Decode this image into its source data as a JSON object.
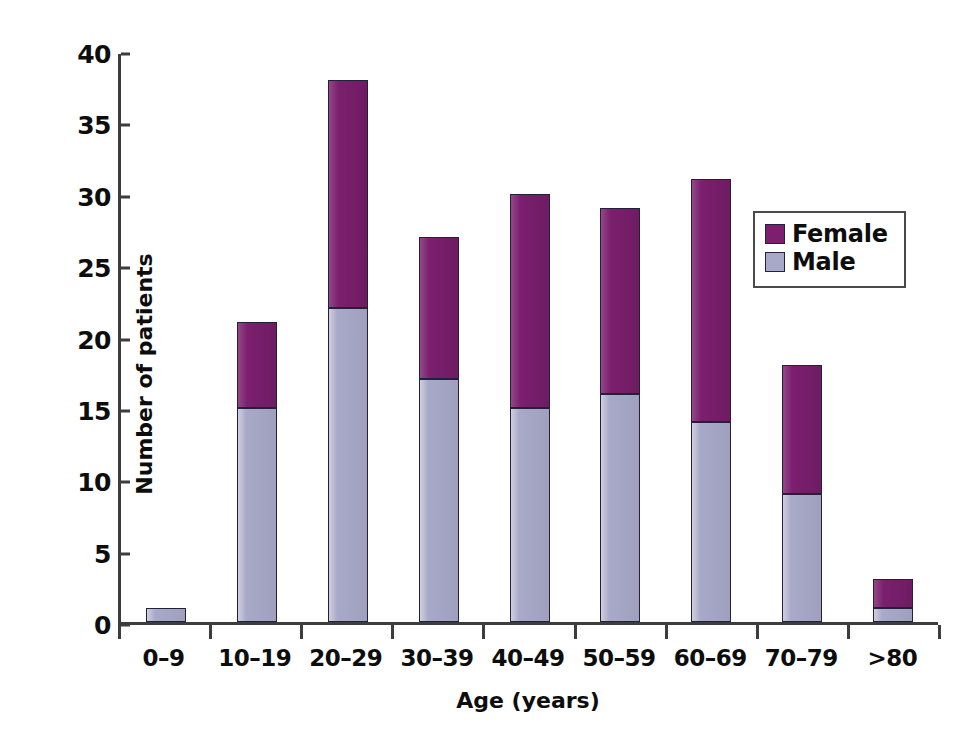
{
  "chart_data": {
    "type": "bar",
    "subtype": "stacked-vertical",
    "title": "",
    "xlabel": "Age (years)",
    "ylabel": "Number of patients",
    "ylim": [
      0,
      40
    ],
    "ytick_step": 5,
    "yticks": [
      "40",
      "35",
      "30",
      "25",
      "20",
      "15",
      "10",
      "5",
      "0"
    ],
    "grid": false,
    "legend_position": "top-right-inside",
    "categories": [
      "0–9",
      "10–19",
      "20–29",
      "30–39",
      "40–49",
      "50–59",
      "60–69",
      "70–79",
      ">80"
    ],
    "series": [
      {
        "name": "Male",
        "color": "#a8a8c8",
        "values": [
          1,
          15,
          22,
          17,
          15,
          16,
          14,
          9,
          1
        ]
      },
      {
        "name": "Female",
        "color": "#7b1f6e",
        "values": [
          0,
          6,
          16,
          10,
          15,
          13,
          17,
          9,
          2
        ]
      }
    ],
    "totals": [
      1,
      21,
      38,
      27,
      30,
      29,
      31,
      18,
      3
    ]
  },
  "legend": {
    "entries": [
      {
        "label": "Female",
        "color": "#7b1f6e"
      },
      {
        "label": "Male",
        "color": "#a8a8c8"
      }
    ]
  },
  "colors": {
    "female": "#7b1f6e",
    "male": "#a8a8c8",
    "axis": "#3d3d3d",
    "text": "#0d0d0d",
    "background": "#ffffff"
  }
}
